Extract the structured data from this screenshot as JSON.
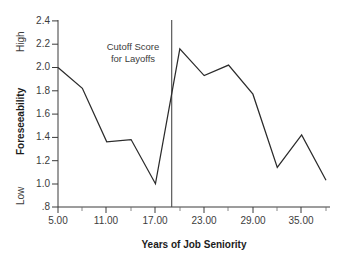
{
  "chart_data": {
    "type": "line",
    "title": "",
    "xlabel": "Years of Job Seniority",
    "ylabel": "Foreseeability",
    "xlim": [
      5,
      38
    ],
    "ylim": [
      0.8,
      2.4
    ],
    "grid": false,
    "legend": "none",
    "x": [
      5,
      8,
      11,
      14,
      17,
      20,
      23,
      26,
      29,
      32,
      35,
      38
    ],
    "values": [
      2.0,
      1.82,
      1.36,
      1.38,
      1.0,
      2.16,
      1.93,
      2.02,
      1.77,
      1.14,
      1.42,
      1.03
    ],
    "series": [
      {
        "name": "Foreseeability",
        "values": [
          2.0,
          1.82,
          1.36,
          1.38,
          1.0,
          2.16,
          1.93,
          2.02,
          1.77,
          1.14,
          1.42,
          1.03
        ]
      }
    ],
    "x_tick_labels": [
      "5.00",
      "11.00",
      "17.00",
      "23.00",
      "29.00",
      "35.00"
    ],
    "x_tick_values": [
      5,
      11,
      17,
      23,
      29,
      35
    ],
    "x_minor_tick_values": [
      8,
      14,
      20,
      26,
      32,
      38
    ],
    "y_tick_labels": [
      ".8",
      "1.0",
      "1.2",
      "1.4",
      "1.6",
      "1.8",
      "2.0",
      "2.2",
      "2.4"
    ],
    "y_tick_values": [
      0.8,
      1.0,
      1.2,
      1.4,
      1.6,
      1.8,
      2.0,
      2.2,
      2.4
    ],
    "y_axis_high_label": "High",
    "y_axis_low_label": "Low",
    "annotations": [
      {
        "name": "cutoff-score-annotation",
        "line1": "Cutoff Score",
        "line2": "for Layoffs",
        "x_value": 19,
        "type": "vertical-line-with-text"
      }
    ],
    "line_color": "#2b2b2b",
    "axis_color": "#3a3a3a",
    "background_color": "#ffffff"
  }
}
